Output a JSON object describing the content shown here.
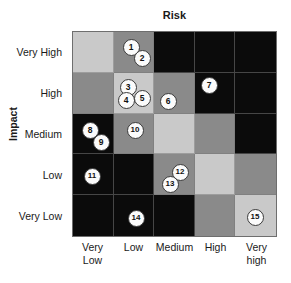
{
  "chart_data": {
    "type": "heatmap",
    "title": "Risk",
    "xlabel": "Risk",
    "ylabel": "Impact",
    "categories": [
      "Very Low",
      "Low",
      "Medium",
      "High",
      "Very high"
    ],
    "y_categories": [
      "Very High",
      "High",
      "Medium",
      "Low",
      "Very Low"
    ],
    "grid": true,
    "legend": "none",
    "colors": {
      "light": "#c9c9c9",
      "medium": "#8a8a8a",
      "dark": "#0b0b0b",
      "bubble_fill": "#fbfbfb",
      "bubble_border": "#3a3a3a",
      "text": "#1a1a1a"
    },
    "cell_shades": [
      [
        "light",
        "medium",
        "dark",
        "dark",
        "dark"
      ],
      [
        "medium",
        "light",
        "medium",
        "dark",
        "dark"
      ],
      [
        "dark",
        "medium",
        "light",
        "medium",
        "dark"
      ],
      [
        "dark",
        "dark",
        "medium",
        "light",
        "medium"
      ],
      [
        "dark",
        "dark",
        "dark",
        "medium",
        "light"
      ]
    ],
    "points": [
      {
        "label": "1",
        "impact": "Very High",
        "risk": "Low",
        "x": 131,
        "y": 47
      },
      {
        "label": "2",
        "impact": "Very High",
        "risk": "Low",
        "x": 142,
        "y": 58
      },
      {
        "label": "3",
        "impact": "High",
        "risk": "Low",
        "x": 128,
        "y": 87
      },
      {
        "label": "4",
        "impact": "High",
        "risk": "Low",
        "x": 126,
        "y": 100
      },
      {
        "label": "5",
        "impact": "High",
        "risk": "Low",
        "x": 142,
        "y": 98
      },
      {
        "label": "6",
        "impact": "High",
        "risk": "Medium",
        "x": 168,
        "y": 101
      },
      {
        "label": "7",
        "impact": "High",
        "risk": "High",
        "x": 209,
        "y": 85
      },
      {
        "label": "8",
        "impact": "Medium",
        "risk": "Very Low",
        "x": 90,
        "y": 130
      },
      {
        "label": "9",
        "impact": "Medium",
        "risk": "Very Low",
        "x": 101,
        "y": 142
      },
      {
        "label": "10",
        "impact": "Medium",
        "risk": "Low",
        "x": 135,
        "y": 130
      },
      {
        "label": "11",
        "impact": "Low",
        "risk": "Very Low",
        "x": 92,
        "y": 176
      },
      {
        "label": "12",
        "impact": "Low",
        "risk": "Medium",
        "x": 180,
        "y": 172
      },
      {
        "label": "13",
        "impact": "Low",
        "risk": "Medium",
        "x": 170,
        "y": 184
      },
      {
        "label": "14",
        "impact": "Very Low",
        "risk": "Low",
        "x": 136,
        "y": 218
      },
      {
        "label": "15",
        "impact": "Very Low",
        "risk": "Very high",
        "x": 255,
        "y": 217
      }
    ]
  }
}
